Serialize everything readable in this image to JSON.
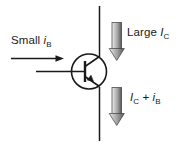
{
  "diagram": {
    "type": "npn-bipolar-transistor-current-amplification",
    "background_color": "#ffffff",
    "line_color": "#1a1a1a",
    "arrow_fill_light": "#e8e8e8",
    "arrow_fill_mid": "#b0b0b0",
    "arrow_fill_dark": "#5a5a5a",
    "labels": {
      "base_current": {
        "prefix": "Small ",
        "symbol": "i",
        "subscript": "B"
      },
      "collector_current": {
        "prefix": "Large ",
        "symbol": "I",
        "subscript": "C"
      },
      "emitter_current": {
        "symbol_1": "I",
        "subscript_1": "C",
        "operator": " + ",
        "symbol_2": "i",
        "subscript_2": "B"
      }
    },
    "elements": {
      "transistor_symbol": "npn-transistor",
      "base_wire": "horizontal-base-lead",
      "collector_wire": "vertical-collector-lead",
      "emitter_wire": "vertical-emitter-lead",
      "base_current_arrow": "thin-right-arrow",
      "collector_current_arrow": "thick-down-block-arrow",
      "emitter_current_arrow": "thick-down-block-arrow"
    }
  }
}
